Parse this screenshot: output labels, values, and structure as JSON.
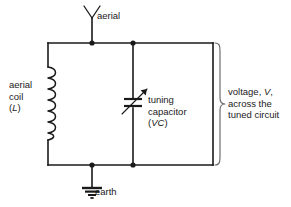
{
  "diagram": {
    "background_color": "#ffffff",
    "line_color": "#1a1a1a",
    "text_color": "#1a1a1a"
  },
  "labels": {
    "aerial": "aerial",
    "earth": "earth",
    "coil_line1": "aerial",
    "coil_line2": "coil",
    "coil_symbol": "(L)",
    "coil_symbol_italic": "L",
    "capacitor_line1": "tuning",
    "capacitor_line2": "capacitor",
    "capacitor_symbol": "(VC)",
    "capacitor_symbol_italic": "VC",
    "voltage_line1_pre": "voltage, ",
    "voltage_line1_italic": "V",
    "voltage_line1_post": ",",
    "voltage_line2": "across the",
    "voltage_line3": "tuned circuit"
  },
  "components": {
    "aerial_symbol": "antenna-y-symbol",
    "inductor_symbol": "coil-inductor-symbol",
    "capacitor_symbol": "variable-capacitor-symbol",
    "earth_symbol": "ground-earth-symbol",
    "brace_symbol": "curly-brace-right"
  }
}
